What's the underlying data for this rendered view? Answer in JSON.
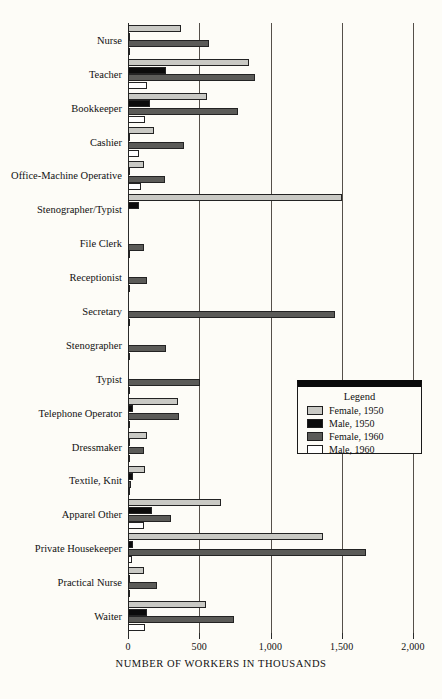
{
  "chart_data": {
    "type": "bar",
    "orientation": "horizontal",
    "title": "",
    "xlabel": "NUMBER OF WORKERS IN THOUSANDS",
    "ylabel": "",
    "xlim": [
      0,
      2000
    ],
    "xticks": [
      "0",
      "500",
      "1,000",
      "1,500",
      "2,000"
    ],
    "xtick_values": [
      0,
      500,
      1000,
      1500,
      2000
    ],
    "grid": "vertical",
    "legend_position": "center-right",
    "legend_title": "Legend",
    "categories": [
      "Nurse",
      "Teacher",
      "Bookkeeper",
      "Cashier",
      "Office-Machine Operative",
      "Stenographer/Typist",
      "File Clerk",
      "Receptionist",
      "Secretary",
      "Stenographer",
      "Typist",
      "Telephone Operator",
      "Dressmaker",
      "Textile, Knit",
      "Apparel Other",
      "Private Housekeeper",
      "Practical Nurse",
      "Waiter"
    ],
    "series": [
      {
        "name": "Female, 1950",
        "color": "#c9c9c4",
        "values": [
          370,
          850,
          555,
          180,
          115,
          1500,
          0,
          0,
          0,
          0,
          0,
          350,
          130,
          120,
          650,
          1370,
          115,
          550
        ]
      },
      {
        "name": "Male, 1950",
        "color": "#0b0b0b",
        "values": [
          15,
          270,
          155,
          12,
          8,
          75,
          0,
          0,
          0,
          0,
          0,
          35,
          10,
          35,
          170,
          35,
          10,
          135
        ]
      },
      {
        "name": "Female, 1960",
        "color": "#5b5b58",
        "values": [
          570,
          890,
          775,
          390,
          260,
          0,
          115,
          130,
          1450,
          265,
          505,
          360,
          115,
          20,
          305,
          1670,
          200,
          745
        ]
      },
      {
        "name": "Male, 1960",
        "color": "#ffffff",
        "values": [
          10,
          130,
          120,
          80,
          90,
          0,
          15,
          10,
          10,
          10,
          10,
          8,
          10,
          10,
          115,
          30,
          12,
          120
        ]
      }
    ]
  }
}
